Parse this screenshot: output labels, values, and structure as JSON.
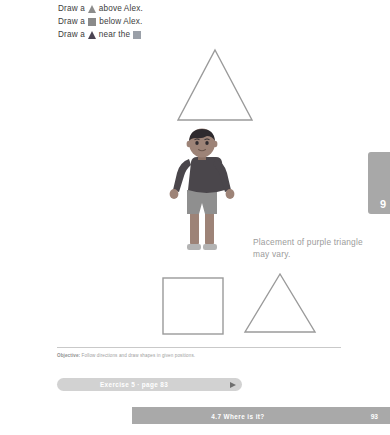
{
  "instructions": [
    {
      "before": "Draw a",
      "icon": "gray-triangle-icon",
      "after": "above Alex."
    },
    {
      "before": "Draw a",
      "icon": "gray-square-icon",
      "after": "below Alex."
    },
    {
      "before": "Draw a",
      "icon": "purple-triangle-icon",
      "after": "near the",
      "trailing_icon": "blue-square-icon"
    }
  ],
  "shapes": {
    "triangle_top": "outlined-triangle",
    "square_bottom": "outlined-square",
    "triangle_bottom": "outlined-triangle"
  },
  "figure": {
    "name": "alex-illustration",
    "alt": "Boy standing with arms out",
    "colors": {
      "hair": "#2e2a2e",
      "skin": "#9d8377",
      "shirt": "#4a464b",
      "shorts": "#8f8f8f",
      "legs": "#9d8377",
      "shoes": "#b3b3b3"
    }
  },
  "note": "Placement of purple triangle may vary.",
  "side_tab": {
    "number": "9"
  },
  "objective": {
    "label": "Objective:",
    "text": "Follow directions and draw shapes in given positions."
  },
  "exercise": {
    "label": "Exercise 5 · page 83",
    "arrow": "arrow-right-icon"
  },
  "footer": {
    "title": "4.7  Where is it?",
    "page": "93"
  },
  "colors": {
    "outline": "#9a9a9a",
    "icon_gray": "#8c8c8c",
    "icon_purple": "#4b4453",
    "icon_blue": "#9aa0a8",
    "bar_gray": "#a9a9a9",
    "exercise_bar": "#d2d2d2",
    "note_text": "#9b9b9b"
  }
}
